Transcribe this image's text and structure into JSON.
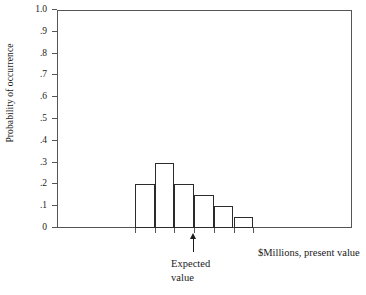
{
  "chart_data": {
    "type": "bar",
    "title": "",
    "subtitle": "",
    "xlabel": "$Millions, present value",
    "ylabel": "Probability of occurrence",
    "categories": [
      "1",
      "2",
      "3",
      "4",
      "5",
      "6"
    ],
    "values": [
      0.2,
      0.3,
      0.2,
      0.15,
      0.1,
      0.05
    ],
    "ylim": [
      0,
      1.0
    ],
    "ytick_labels": [
      "1.0",
      ".9",
      ".8",
      ".7",
      ".6",
      ".5",
      ".4",
      ".3",
      ".2",
      ".1",
      "0"
    ],
    "ytick_values": [
      1.0,
      0.9,
      0.8,
      0.7,
      0.6,
      0.5,
      0.4,
      0.3,
      0.2,
      0.1,
      0
    ],
    "xtick_labels": [
      "",
      "",
      "",
      "",
      "",
      "",
      ""
    ],
    "grid": false,
    "legend": null,
    "legend_position": "none",
    "annotations": [
      {
        "name": "expected-value",
        "text_line1": "Expected",
        "text_line2": "value",
        "marker": "up-arrow",
        "at_category_boundary": 3
      }
    ],
    "bar_style": {
      "fill": "#ffffff",
      "edge": "#2b2b2b",
      "edge_width": 1.4,
      "contiguous": true
    },
    "axis_color": "#555555",
    "text_color": "#1a1a1a",
    "background": "#ffffff"
  }
}
